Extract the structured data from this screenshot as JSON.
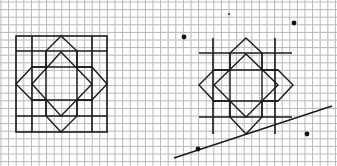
{
  "grid": {
    "cell_size": 7.6,
    "origin_x": 1,
    "origin_y": 0,
    "line_color": "#b8b8b8",
    "background": "#ffffff"
  },
  "figures": {
    "stroke_color": "#1a1a1a",
    "left_figure": {
      "label": "square grid with eight-pointed star",
      "frame": {
        "x": 16,
        "y": 36,
        "w": 91,
        "h": 96
      },
      "frame_lines": [
        [
          16,
          51,
          107,
          51
        ],
        [
          16,
          116,
          107,
          116
        ],
        [
          32,
          36,
          32,
          132
        ],
        [
          92,
          36,
          92,
          132
        ]
      ],
      "star_outline": [
        [
          61,
          36
        ],
        [
          77,
          51
        ],
        [
          77,
          67
        ],
        [
          92,
          67
        ],
        [
          107,
          84
        ],
        [
          92,
          100
        ],
        [
          77,
          100
        ],
        [
          77,
          116
        ],
        [
          61,
          132
        ],
        [
          46,
          116
        ],
        [
          46,
          100
        ],
        [
          32,
          100
        ],
        [
          16,
          84
        ],
        [
          32,
          67
        ],
        [
          46,
          67
        ],
        [
          46,
          51
        ]
      ],
      "inner_diamond": [
        [
          61,
          52
        ],
        [
          92,
          84
        ],
        [
          61,
          116
        ],
        [
          32,
          84
        ]
      ],
      "inner_square_lines": [
        [
          32,
          67,
          92,
          67
        ],
        [
          32,
          100,
          92,
          100
        ],
        [
          46,
          51,
          46,
          116
        ],
        [
          77,
          51,
          77,
          116
        ]
      ]
    },
    "right_figure": {
      "label": "eight-pointed star with crossing lines",
      "cross_lines": [
        [
          213,
          38,
          213,
          134
        ],
        [
          275,
          38,
          275,
          134
        ],
        [
          199,
          53,
          292,
          53
        ],
        [
          199,
          117,
          292,
          117
        ]
      ],
      "star_outline": [
        [
          246,
          38
        ],
        [
          262,
          53
        ],
        [
          262,
          70
        ],
        [
          278,
          70
        ],
        [
          293,
          85
        ],
        [
          278,
          101
        ],
        [
          262,
          101
        ],
        [
          262,
          117
        ],
        [
          246,
          134
        ],
        [
          230,
          117
        ],
        [
          230,
          101
        ],
        [
          214,
          101
        ],
        [
          199,
          85
        ],
        [
          214,
          70
        ],
        [
          230,
          70
        ],
        [
          230,
          53
        ]
      ],
      "inner_diamond": [
        [
          246,
          54
        ],
        [
          278,
          85
        ],
        [
          246,
          117
        ],
        [
          214,
          85
        ]
      ],
      "inner_square_lines": [
        [
          214,
          70,
          278,
          70
        ],
        [
          214,
          101,
          278,
          101
        ],
        [
          230,
          53,
          230,
          117
        ],
        [
          262,
          53,
          262,
          117
        ]
      ]
    },
    "line": {
      "x1": 174,
      "y1": 158,
      "x2": 332,
      "y2": 106
    },
    "points": [
      {
        "x": 184,
        "y": 37,
        "r": 2.4
      },
      {
        "x": 294,
        "y": 23,
        "r": 2.4
      },
      {
        "x": 198,
        "y": 149,
        "r": 2.4
      },
      {
        "x": 307,
        "y": 134,
        "r": 2.4
      },
      {
        "x": 229,
        "y": 14,
        "r": 0.9
      }
    ]
  }
}
